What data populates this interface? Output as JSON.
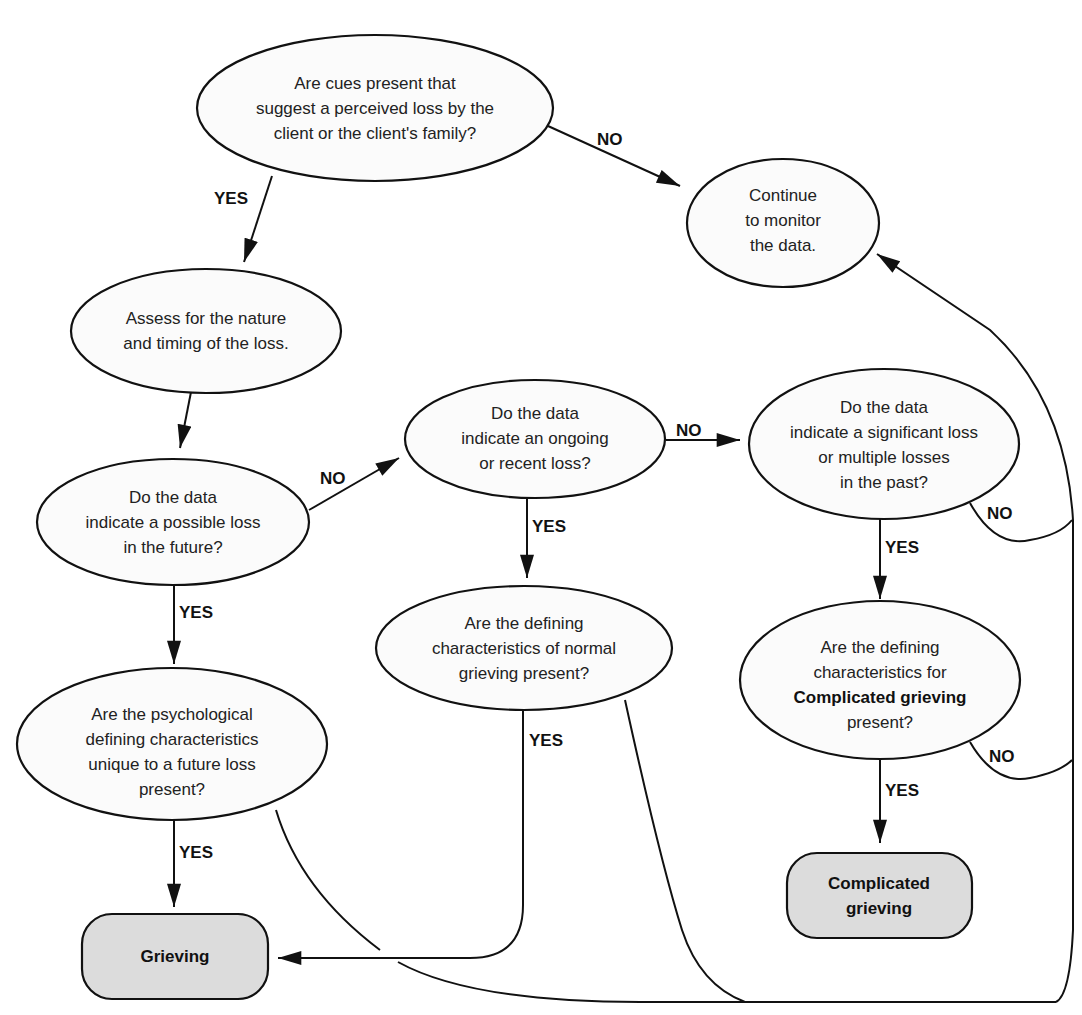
{
  "diagram": {
    "type": "flowchart",
    "nodes": {
      "q_cues": {
        "shape": "ellipse",
        "lines": [
          "Are cues present that",
          "suggest a perceived loss by the",
          "client or the client's family?"
        ]
      },
      "continue_monitor": {
        "shape": "ellipse",
        "lines": [
          "Continue",
          "to monitor",
          "the data."
        ]
      },
      "assess": {
        "shape": "ellipse",
        "lines": [
          "Assess for the nature",
          "and timing of the loss."
        ]
      },
      "q_future": {
        "shape": "ellipse",
        "lines": [
          "Do the data",
          "indicate a possible loss",
          "in the future?"
        ]
      },
      "q_ongoing": {
        "shape": "ellipse",
        "lines": [
          "Do the data",
          "indicate an ongoing",
          "or recent loss?"
        ]
      },
      "q_past": {
        "shape": "ellipse",
        "lines": [
          "Do the data",
          "indicate a significant loss",
          "or multiple losses",
          "in the past?"
        ]
      },
      "q_normal": {
        "shape": "ellipse",
        "lines": [
          "Are the defining",
          "characteristics of normal",
          "grieving present?"
        ]
      },
      "q_complicated": {
        "shape": "ellipse",
        "lines": [
          "Are the defining",
          "characteristics for",
          "Complicated grieving",
          "present?"
        ],
        "bold_line_index": 2
      },
      "q_psych": {
        "shape": "ellipse",
        "lines": [
          "Are the psychological",
          "defining characteristics",
          "unique to a future loss",
          "present?"
        ]
      },
      "grieving": {
        "shape": "rounded-rect",
        "lines": [
          "Grieving"
        ]
      },
      "complicated_grieving": {
        "shape": "rounded-rect",
        "lines": [
          "Complicated",
          "grieving"
        ]
      }
    },
    "edges": [
      {
        "from": "q_cues",
        "to": "continue_monitor",
        "label": "NO"
      },
      {
        "from": "q_cues",
        "to": "assess",
        "label": "YES"
      },
      {
        "from": "assess",
        "to": "q_future",
        "label": ""
      },
      {
        "from": "q_future",
        "to": "q_ongoing",
        "label": "NO"
      },
      {
        "from": "q_future",
        "to": "q_psych",
        "label": "YES"
      },
      {
        "from": "q_ongoing",
        "to": "q_past",
        "label": "NO"
      },
      {
        "from": "q_ongoing",
        "to": "q_normal",
        "label": "YES"
      },
      {
        "from": "q_past",
        "to": "q_complicated",
        "label": "YES"
      },
      {
        "from": "q_past",
        "to": "continue_monitor",
        "label": "NO"
      },
      {
        "from": "q_complicated",
        "to": "complicated_grieving",
        "label": "YES"
      },
      {
        "from": "q_complicated",
        "to": "continue_monitor",
        "label": "NO"
      },
      {
        "from": "q_normal",
        "to": "grieving",
        "label": "YES"
      },
      {
        "from": "q_normal",
        "to": "continue_monitor",
        "label": ""
      },
      {
        "from": "q_psych",
        "to": "grieving",
        "label": "YES"
      },
      {
        "from": "q_psych",
        "to": "continue_monitor",
        "label": ""
      }
    ],
    "labels": {
      "yes": "YES",
      "no": "NO"
    },
    "colors": {
      "stroke": "#111111",
      "ellipse_fill": "#fbfbfb",
      "terminal_fill": "#dcdcdc",
      "text": "#222222"
    }
  }
}
